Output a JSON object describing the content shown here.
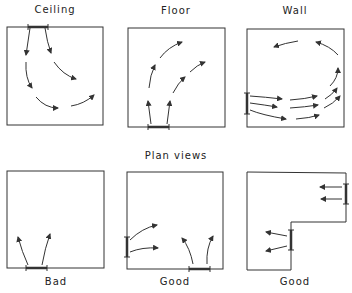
{
  "section_labels": {
    "elevation": [
      "Ceiling",
      "Floor",
      "Wall"
    ],
    "plan_title": "Plan views"
  },
  "plan_labels": [
    "Bad",
    "Good",
    "Good"
  ],
  "panels": [
    {
      "id": "ceiling",
      "label": "Ceiling",
      "inlet": "top",
      "flow": "arrows curve down and around"
    },
    {
      "id": "floor",
      "label": "Floor",
      "inlet": "bottom",
      "flow": "arrows curve up and right"
    },
    {
      "id": "wall",
      "label": "Wall",
      "inlet": "left",
      "flow": "arrows horizontally right and circulate"
    },
    {
      "id": "plan-bad",
      "label": "Bad",
      "inlet": "bottom",
      "flow": "two short arrows up"
    },
    {
      "id": "plan-good-1",
      "label": "Good",
      "inlet": "left and bottom",
      "flow": "arrows spread into room"
    },
    {
      "id": "plan-good-2",
      "label": "Good",
      "inlet": "right walls of L-shaped room",
      "flow": "arrows leftward"
    }
  ],
  "colors": {
    "line": "#333333",
    "background": "#ffffff"
  }
}
